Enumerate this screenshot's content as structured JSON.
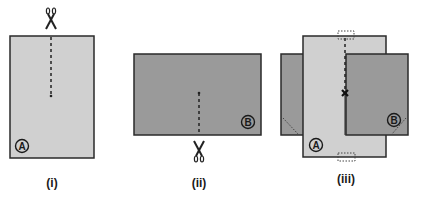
{
  "figures": [
    {
      "id": "i",
      "caption": "(i)",
      "sheet_label": "A",
      "sheet_color": "#d0d0d0",
      "description": "Sheet A with a cut from the top edge down to the middle; scissors at top"
    },
    {
      "id": "ii",
      "caption": "(ii)",
      "sheet_label": "B",
      "sheet_color": "#9a9a9a",
      "description": "Sheet B with a cut from the bottom edge up to the middle; scissors at bottom"
    },
    {
      "id": "iii",
      "caption": "(iii)",
      "sheet_labels": [
        "A",
        "B"
      ],
      "description": "Sheets A and B slotted together along the cuts, intersection point marked with x, dotted tabs at top and bottom of A"
    }
  ],
  "colors": {
    "sheet_a": "#d0d0d0",
    "sheet_b": "#9a9a9a",
    "outline": "#2a2a2a",
    "cut_line": "#222222"
  },
  "icons": {
    "scissors": "scissors-icon",
    "intersection": "x-mark-icon"
  }
}
